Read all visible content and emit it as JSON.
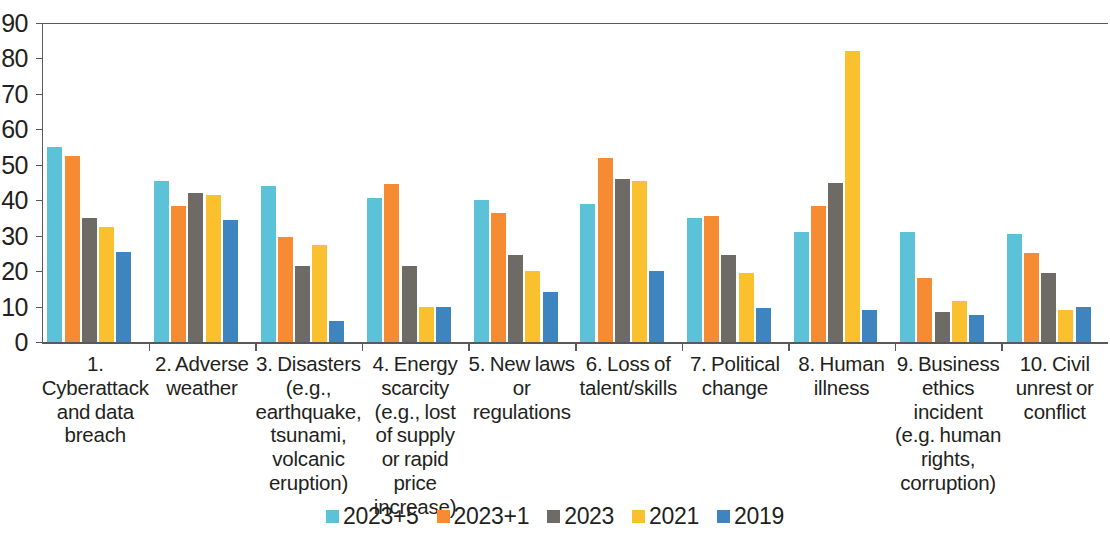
{
  "chart_data": {
    "type": "bar",
    "title": "",
    "xlabel": "",
    "ylabel": "",
    "ylim": [
      0,
      90
    ],
    "ytick_step": 10,
    "yticks": [
      90,
      80,
      70,
      60,
      50,
      40,
      30,
      20,
      10,
      0
    ],
    "grid": false,
    "legend_position": "bottom",
    "categories": [
      "1. Cyberattack and data breach",
      "2. Adverse weather",
      "3. Disasters (e.g., earthquake, tsunami, volcanic eruption)",
      "4. Energy scarcity (e.g., lost of supply or rapid price increase)",
      "5. New laws or regulations",
      "6. Loss of talent/skills",
      "7. Political change",
      "8. Human illness",
      "9. Business ethics incident (e.g. human rights, corruption)",
      "10. Civil unrest or conflict"
    ],
    "category_lines": [
      [
        "1. Cyberattack",
        "and data",
        "breach"
      ],
      [
        "2. Adverse",
        "weather"
      ],
      [
        "3. Disasters",
        "(e.g.,",
        "earthquake,",
        "tsunami,",
        "volcanic",
        "eruption)"
      ],
      [
        "4. Energy",
        "scarcity",
        "(e.g., lost",
        "of supply",
        "or rapid price",
        "increase)"
      ],
      [
        "5. New laws",
        "or",
        "regulations"
      ],
      [
        "6. Loss of",
        "talent/skills"
      ],
      [
        "7. Political",
        "change"
      ],
      [
        "8. Human",
        "illness"
      ],
      [
        "9. Business",
        "ethics incident",
        "(e.g. human",
        "rights,",
        "corruption)"
      ],
      [
        "10. Civil",
        "unrest or",
        "conflict"
      ]
    ],
    "series": [
      {
        "name": "2023+5",
        "color": "#5BC2D8",
        "values": [
          55,
          45.5,
          44,
          40.5,
          40,
          39,
          35,
          31,
          31,
          30.5
        ]
      },
      {
        "name": "2023+1",
        "color": "#F68B33",
        "values": [
          52.5,
          38.5,
          29.5,
          44.5,
          36.5,
          52,
          35.5,
          38.5,
          18,
          25
        ]
      },
      {
        "name": "2023",
        "color": "#6E6B66",
        "values": [
          35,
          42,
          21.5,
          21.5,
          24.5,
          46,
          24.5,
          45,
          8.5,
          19.5
        ]
      },
      {
        "name": "2021",
        "color": "#FBC02D",
        "values": [
          32.5,
          41.5,
          27.5,
          10,
          20,
          45.5,
          19.5,
          82,
          11.5,
          9
        ]
      },
      {
        "name": "2019",
        "color": "#3E85C0",
        "values": [
          25.5,
          34.5,
          6,
          9.8,
          14,
          20,
          9.5,
          9,
          7.5,
          10
        ]
      }
    ]
  },
  "axis": {
    "axis_color": "#58595b"
  },
  "legend": {
    "items": [
      {
        "label": "2023+5",
        "color": "#5BC2D8"
      },
      {
        "label": "2023+1",
        "color": "#F68B33"
      },
      {
        "label": "2023",
        "color": "#6E6B66"
      },
      {
        "label": "2021",
        "color": "#FBC02D"
      },
      {
        "label": "2019",
        "color": "#3E85C0"
      }
    ]
  }
}
